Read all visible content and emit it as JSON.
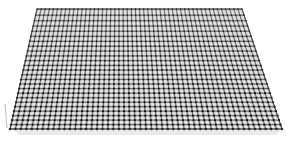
{
  "scene": {
    "width": 288,
    "height": 141,
    "background": "#ffffff",
    "surface": {
      "type": "perspective-grid-plane",
      "corners": {
        "top_left": [
          37,
          9
        ],
        "top_right": [
          242,
          9
        ],
        "bottom_right": [
          282,
          129
        ],
        "bottom_left": [
          10,
          129
        ]
      },
      "columns": 50,
      "rows": 25,
      "cell_fill": "#c9c9c9",
      "cell_highlight": "#e6e6e6",
      "line_color": "#2a2a2a",
      "node_color": "#111111",
      "edge_color": "#333333"
    },
    "axis_stub": {
      "x": 5,
      "y1": 104,
      "y2": 128,
      "color": "#bdbdbd"
    },
    "shadow": {
      "color": "#e9e9e9"
    }
  }
}
